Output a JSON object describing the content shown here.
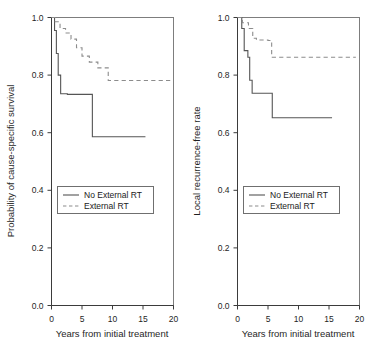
{
  "figure": {
    "background": "#ffffff",
    "panel_count": 2
  },
  "chart_data": [
    {
      "type": "line",
      "panel": "left",
      "title": "",
      "xlabel": "Years from initial treatment",
      "ylabel": "Probability of cause-specific survival",
      "xlim": [
        0,
        20
      ],
      "ylim": [
        0.0,
        1.0
      ],
      "xticks": [
        0,
        5,
        10,
        15,
        20
      ],
      "xticklabels": [
        "0",
        "5",
        "10",
        "15",
        "20"
      ],
      "yticks": [
        0.0,
        0.2,
        0.4,
        0.6,
        0.8,
        1.0
      ],
      "yticklabels": [
        "0.0",
        "0.2",
        "0.4",
        "0.6",
        "0.8",
        "1.0"
      ],
      "grid": false,
      "legend_position": "center-left",
      "series": [
        {
          "name": "No External RT",
          "style": "solid",
          "color": "#555555",
          "step": "post",
          "x": [
            0.0,
            0.5,
            0.5,
            0.8,
            0.8,
            1.1,
            1.1,
            1.5,
            1.5,
            2.6,
            2.6,
            6.7,
            6.7,
            15.4
          ],
          "y": [
            1.0,
            1.0,
            0.955,
            0.955,
            0.875,
            0.875,
            0.8,
            0.8,
            0.735,
            0.735,
            0.733,
            0.733,
            0.586,
            0.586
          ]
        },
        {
          "name": "External RT",
          "style": "dashed",
          "color": "#8c8c8c",
          "step": "post",
          "x": [
            0.0,
            0.6,
            0.6,
            1.4,
            1.4,
            2.3,
            2.3,
            3.2,
            3.2,
            4.1,
            4.1,
            5.0,
            5.0,
            6.2,
            6.2,
            7.6,
            7.6,
            9.3,
            9.3,
            19.6
          ],
          "y": [
            1.0,
            1.0,
            0.985,
            0.985,
            0.962,
            0.962,
            0.946,
            0.946,
            0.925,
            0.925,
            0.895,
            0.895,
            0.866,
            0.866,
            0.845,
            0.845,
            0.825,
            0.825,
            0.781,
            0.781
          ]
        }
      ],
      "legend": [
        {
          "label": "No External RT",
          "style": "solid"
        },
        {
          "label": "External RT",
          "style": "dashed"
        }
      ]
    },
    {
      "type": "line",
      "panel": "right",
      "title": "",
      "xlabel": "Years from initial treatment",
      "ylabel": "Local recurrence-free rate",
      "xlim": [
        0,
        20
      ],
      "ylim": [
        0.0,
        1.0
      ],
      "xticks": [
        0,
        5,
        10,
        15,
        20
      ],
      "xticklabels": [
        "0",
        "5",
        "10",
        "15",
        "20"
      ],
      "yticks": [
        0.0,
        0.2,
        0.4,
        0.6,
        0.8,
        1.0
      ],
      "yticklabels": [
        "0.0",
        "0.2",
        "0.4",
        "0.6",
        "0.8",
        "1.0"
      ],
      "grid": false,
      "legend_position": "center-left",
      "series": [
        {
          "name": "No External RT",
          "style": "solid",
          "color": "#555555",
          "step": "post",
          "x": [
            0.0,
            0.7,
            0.7,
            1.1,
            1.1,
            1.7,
            1.7,
            2.0,
            2.0,
            2.4,
            2.4,
            5.7,
            5.7,
            15.5
          ],
          "y": [
            1.0,
            1.0,
            0.962,
            0.962,
            0.885,
            0.885,
            0.862,
            0.862,
            0.782,
            0.782,
            0.737,
            0.737,
            0.652,
            0.652
          ]
        },
        {
          "name": "External RT",
          "style": "dashed",
          "color": "#8c8c8c",
          "step": "post",
          "x": [
            0.0,
            0.8,
            0.8,
            1.8,
            1.8,
            2.5,
            2.5,
            3.1,
            3.1,
            5.0,
            5.0,
            5.6,
            5.6,
            19.4
          ],
          "y": [
            1.0,
            1.0,
            0.982,
            0.982,
            0.962,
            0.962,
            0.928,
            0.928,
            0.922,
            0.922,
            0.92,
            0.92,
            0.862,
            0.862
          ]
        }
      ],
      "legend": [
        {
          "label": "No External RT",
          "style": "solid"
        },
        {
          "label": "External RT",
          "style": "dashed"
        }
      ]
    }
  ]
}
